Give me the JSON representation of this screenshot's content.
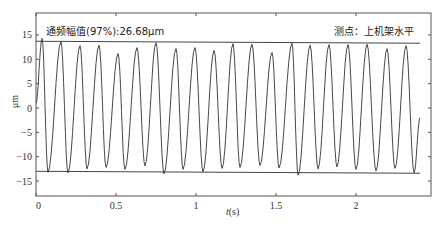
{
  "chart_data": {
    "type": "line",
    "title": "",
    "xlabel": "t(s)",
    "xlabel_italic_part": "t",
    "xlabel_unit_part": "(s)",
    "ylabel": "μm",
    "xlim": [
      0,
      2.46
    ],
    "ylim": [
      -18,
      19.5
    ],
    "xticks": [
      0,
      0.5,
      1,
      1.5,
      2
    ],
    "xtick_labels": [
      "0",
      "0.5",
      "1",
      "1.5",
      "2"
    ],
    "yticks": [
      15,
      10,
      5,
      0,
      -5,
      -10,
      -15
    ],
    "ytick_labels": [
      "15",
      "10",
      "5",
      "0",
      "−5",
      "−10",
      "−15"
    ],
    "grid": false,
    "annotations": {
      "amplitude": "通频幅值(97%):26.68μm",
      "measure_point": "测点：上机架水平"
    },
    "envelope": {
      "upper": {
        "x": [
          0,
          2.4
        ],
        "y": [
          13.7,
          13.3
        ]
      },
      "lower": {
        "x": [
          0,
          2.4
        ],
        "y": [
          -13.0,
          -13.4
        ]
      }
    },
    "series": [
      {
        "name": "vibration",
        "x": [
          0,
          0.038,
          0.075,
          0.156,
          0.2,
          0.275,
          0.319,
          0.394,
          0.438,
          0.513,
          0.556,
          0.631,
          0.681,
          0.75,
          0.8,
          0.875,
          0.919,
          0.994,
          1.044,
          1.113,
          1.163,
          1.231,
          1.275,
          1.35,
          1.4,
          1.475,
          1.519,
          1.6,
          1.638,
          1.713,
          1.763,
          1.831,
          1.881,
          1.95,
          2.0,
          2.069,
          2.125,
          2.194,
          2.244,
          2.313,
          2.363,
          2.4
        ],
        "y": [
          1.0,
          14.3,
          -13.2,
          13.6,
          -13.3,
          12.8,
          -12.5,
          12.9,
          -12.2,
          11.2,
          -12.6,
          12.4,
          -11.9,
          13.4,
          -13.5,
          12.2,
          -12.6,
          12.4,
          -13.1,
          11.8,
          -12.4,
          13.2,
          -12.2,
          13.1,
          -11.8,
          11.4,
          -12.3,
          13.3,
          -13.8,
          12.9,
          -12.5,
          13.0,
          -12.1,
          13.0,
          -12.6,
          13.1,
          -12.9,
          12.2,
          -12.4,
          12.8,
          -13.3,
          -2.0
        ]
      }
    ]
  }
}
